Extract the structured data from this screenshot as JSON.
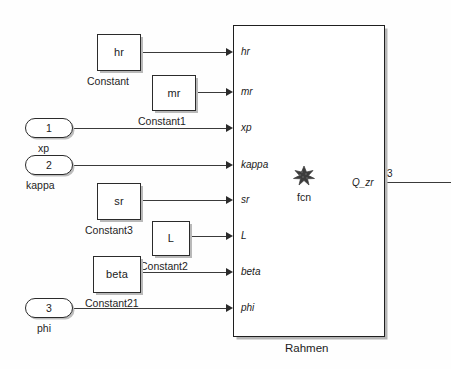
{
  "diagram": {
    "title": "Rahmen",
    "subsystem_caption": "Rahmen",
    "fcn_label": "fcn",
    "colors": {
      "line": "#3a3a3a",
      "block_border": "#2b2b2b",
      "background": "#fefefe",
      "shadow": "#b9b9b9"
    }
  },
  "constants": [
    {
      "value": "hr",
      "caption": "Constant"
    },
    {
      "value": "mr",
      "caption": "Constant1"
    },
    {
      "value": "sr",
      "caption": "Constant3"
    },
    {
      "value": "L",
      "caption": "Constant2"
    },
    {
      "value": "beta",
      "caption": "Constant21"
    }
  ],
  "inports": [
    {
      "number": "1",
      "caption": "xp"
    },
    {
      "number": "2",
      "caption": "kappa"
    },
    {
      "number": "3",
      "caption": "phi"
    }
  ],
  "subsystem": {
    "input_ports": [
      {
        "label": "hr"
      },
      {
        "label": "mr"
      },
      {
        "label": "xp"
      },
      {
        "label": "kappa"
      },
      {
        "label": "sr"
      },
      {
        "label": "L"
      },
      {
        "label": "beta"
      },
      {
        "label": "phi"
      }
    ],
    "output_ports": [
      {
        "label": "Q_zr",
        "signal_number": "3"
      }
    ]
  }
}
